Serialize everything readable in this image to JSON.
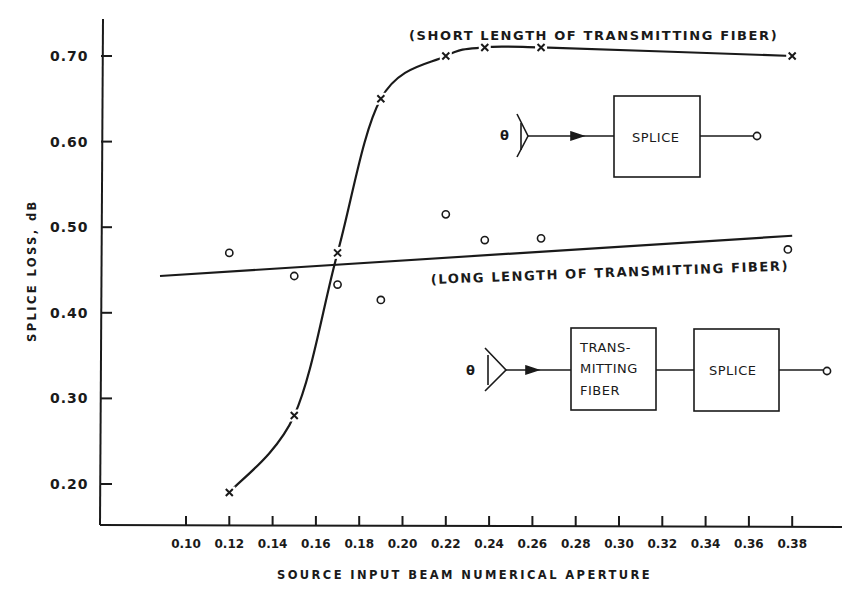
{
  "chart_data": {
    "type": "scatter",
    "title": "",
    "xlabel": "SOURCE INPUT BEAM NUMERICAL APERTURE",
    "ylabel": "SPLICE LOSS, dB",
    "xlim": [
      0.08,
      0.4
    ],
    "ylim": [
      0.15,
      0.74
    ],
    "grid": false,
    "x_ticks": [
      "0.10",
      "0.12",
      "0.14",
      "0.16",
      "0.18",
      "0.20",
      "0.22",
      "0.24",
      "0.26",
      "0.28",
      "0.30",
      "0.32",
      "0.34",
      "0.36",
      "0.38"
    ],
    "y_ticks": [
      "0.20",
      "0.30",
      "0.40",
      "0.50",
      "0.60",
      "0.70"
    ],
    "series": [
      {
        "name": "(SHORT LENGTH OF TRANSMITTING FIBER)",
        "marker": "x",
        "fit": "sigmoid curve",
        "x": [
          0.12,
          0.15,
          0.17,
          0.19,
          0.22,
          0.238,
          0.264,
          0.38
        ],
        "y": [
          0.19,
          0.28,
          0.47,
          0.65,
          0.7,
          0.71,
          0.71,
          0.7
        ]
      },
      {
        "name": "(LONG LENGTH OF TRANSMITTING FIBER)",
        "marker": "o",
        "fit": "linear",
        "fit_line": {
          "x": [
            0.088,
            0.38
          ],
          "y": [
            0.443,
            0.49
          ]
        },
        "x": [
          0.12,
          0.15,
          0.17,
          0.19,
          0.22,
          0.238,
          0.264,
          0.378
        ],
        "y": [
          0.47,
          0.443,
          0.433,
          0.415,
          0.515,
          0.485,
          0.487,
          0.474
        ]
      }
    ],
    "annotations": [
      "(SHORT LENGTH OF TRANSMITTING FIBER)",
      "(LONG LENGTH OF TRANSMITTING FIBER)"
    ]
  },
  "diagrams": {
    "top": {
      "theta": "θ",
      "splice": "SPLICE"
    },
    "bottom": {
      "theta": "θ",
      "fiber_lines": [
        "TRANS-",
        "MITTING",
        "FIBER"
      ],
      "splice": "SPLICE"
    }
  }
}
